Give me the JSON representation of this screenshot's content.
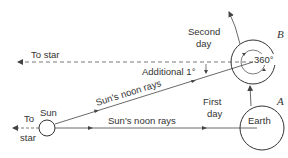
{
  "diagram": {
    "labels": {
      "to_star_top": "To star",
      "to_star_left_1": "To",
      "to_star_left_2": "star",
      "sun": "Sun",
      "earth": "Earth",
      "point_a": "A",
      "point_b": "B",
      "first_day_1": "First",
      "first_day_2": "day",
      "second_day_1": "Second",
      "second_day_2": "day",
      "additional": "Additional 1°",
      "rotation": "360°",
      "noon_rays_diag": "Sun's noon rays",
      "noon_rays_horiz": "Sun's noon rays"
    },
    "colors": {
      "line": "#444444",
      "text": "#333333",
      "background": "#ffffff"
    }
  }
}
